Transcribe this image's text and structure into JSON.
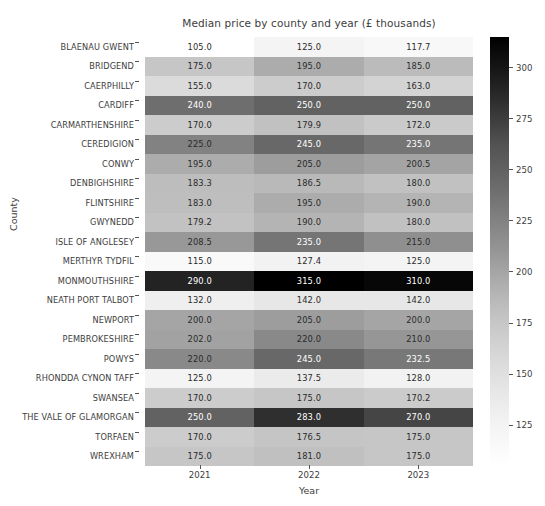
{
  "chart_data": {
    "type": "heatmap",
    "title": "Median price by county and year (£ thousands)",
    "xlabel": "Year",
    "ylabel": "County",
    "categories_x": [
      "2021",
      "2022",
      "2023"
    ],
    "categories_y": [
      "BLAENAU GWENT",
      "BRIDGEND",
      "CAERPHILLY",
      "CARDIFF",
      "CARMARTHENSHIRE",
      "CEREDIGION",
      "CONWY",
      "DENBIGHSHIRE",
      "FLINTSHIRE",
      "GWYNEDD",
      "ISLE OF ANGLESEY",
      "MERTHYR TYDFIL",
      "MONMOUTHSHIRE",
      "NEATH PORT TALBOT",
      "NEWPORT",
      "PEMBROKESHIRE",
      "POWYS",
      "RHONDDA CYNON TAFF",
      "SWANSEA",
      "THE VALE OF GLAMORGAN",
      "TORFAEN",
      "WREXHAM"
    ],
    "values": [
      [
        105.0,
        125.0,
        117.7
      ],
      [
        175.0,
        195.0,
        185.0
      ],
      [
        155.0,
        170.0,
        163.0
      ],
      [
        240.0,
        250.0,
        250.0
      ],
      [
        170.0,
        179.9,
        172.0
      ],
      [
        225.0,
        245.0,
        235.0
      ],
      [
        195.0,
        205.0,
        200.5
      ],
      [
        183.3,
        186.5,
        180.0
      ],
      [
        183.0,
        195.0,
        190.0
      ],
      [
        179.2,
        190.0,
        180.0
      ],
      [
        208.5,
        235.0,
        215.0
      ],
      [
        115.0,
        127.4,
        125.0
      ],
      [
        290.0,
        315.0,
        310.0
      ],
      [
        132.0,
        142.0,
        142.0
      ],
      [
        200.0,
        205.0,
        200.0
      ],
      [
        202.0,
        220.0,
        210.0
      ],
      [
        220.0,
        245.0,
        232.5
      ],
      [
        125.0,
        137.5,
        128.0
      ],
      [
        170.0,
        175.0,
        170.2
      ],
      [
        250.0,
        283.0,
        270.0
      ],
      [
        170.0,
        176.5,
        175.0
      ],
      [
        175.0,
        181.0,
        175.0
      ]
    ],
    "annotations": [
      [
        "105.0",
        "125.0",
        "117.7"
      ],
      [
        "175.0",
        "195.0",
        "185.0"
      ],
      [
        "155.0",
        "170.0",
        "163.0"
      ],
      [
        "240.0",
        "250.0",
        "250.0"
      ],
      [
        "170.0",
        "179.9",
        "172.0"
      ],
      [
        "225.0",
        "245.0",
        "235.0"
      ],
      [
        "195.0",
        "205.0",
        "200.5"
      ],
      [
        "183.3",
        "186.5",
        "180.0"
      ],
      [
        "183.0",
        "195.0",
        "190.0"
      ],
      [
        "179.2",
        "190.0",
        "180.0"
      ],
      [
        "208.5",
        "235.0",
        "215.0"
      ],
      [
        "115.0",
        "127.4",
        "125.0"
      ],
      [
        "290.0",
        "315.0",
        "310.0"
      ],
      [
        "132.0",
        "142.0",
        "142.0"
      ],
      [
        "200.0",
        "205.0",
        "200.0"
      ],
      [
        "202.0",
        "220.0",
        "210.0"
      ],
      [
        "220.0",
        "245.0",
        "232.5"
      ],
      [
        "125.0",
        "137.5",
        "128.0"
      ],
      [
        "170.0",
        "175.0",
        "170.2"
      ],
      [
        "250.0",
        "283.0",
        "270.0"
      ],
      [
        "170.0",
        "176.5",
        "175.0"
      ],
      [
        "175.0",
        "181.0",
        "175.0"
      ]
    ],
    "colormap": "Greys",
    "colorbar": {
      "ticks": [
        125,
        150,
        175,
        200,
        225,
        250,
        275,
        300
      ],
      "tick_labels": [
        "125",
        "150",
        "175",
        "200",
        "225",
        "250",
        "275",
        "300"
      ],
      "vmin": 105.0,
      "vmax": 315.0,
      "orientation": "vertical",
      "position": "right"
    },
    "grid": false,
    "value_range": [
      105.0,
      315.0
    ]
  },
  "colors": {
    "background": "#ffffff",
    "text": "#3d3d3d",
    "tick_mark": "#555555",
    "cmap_low": "#ffffff",
    "cmap_high": "#000000"
  }
}
